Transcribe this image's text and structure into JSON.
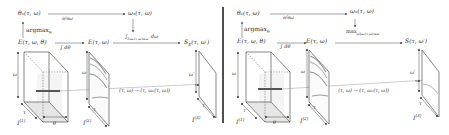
{
  "divider": {
    "x": 223,
    "y1": 7,
    "y2": 123,
    "color": "#222222"
  },
  "colors": {
    "line": "#555555",
    "light_line": "#888888",
    "face_fill": "#eeeeee",
    "bar": "#555555"
  },
  "panels": [
    {
      "id": "left",
      "theta_node": "θₑ(τ, ω)",
      "omega_node": "ωₑ(τ, ω)",
      "derivative_label": "∂/∂ω",
      "argmax_label": "argmax",
      "argmax_sub": "θ",
      "E_full_node": "E(τ, ω, θ)",
      "integral_theta_label": "∫",
      "integral_theta_limits": "π −π",
      "integral_theta_tail": "dθ",
      "E_node": "E(τ, ω)",
      "reduce_label": "∫",
      "reduce_sub": "δωₑ(τ,ω)=ω′",
      "reduce_tail": "dω",
      "output_node": "S",
      "output_sub": "E",
      "output_args": "(τ, ω′)",
      "mapping_label": "(τ, ω) → (τ, ωₑ(τ, ω))",
      "volume_labels": {
        "omega": "ω",
        "tau": "τ",
        "theta": "θ",
        "name": "I",
        "index": "(1)"
      },
      "slice2_labels": {
        "omega": "ω",
        "tau": "τ",
        "name": "I",
        "index": "(2)"
      },
      "slice3_labels": {
        "omega": "ω′",
        "tau": "τ",
        "name": "I",
        "index": "(3)"
      }
    },
    {
      "id": "right",
      "theta_node": "θₑ(τ, ω)",
      "omega_node": "ωₑ(τ, ω)",
      "derivative_label": "∂/∂ω",
      "argmax_label": "argmax",
      "argmax_sub": "θ",
      "E_full_node": "E(τ, ω, θ)",
      "integral_theta_label": "∫",
      "integral_theta_limits": "π −π",
      "integral_theta_tail": "dθ",
      "E_node": "E(τ, ω)",
      "reduce_label": "max",
      "reduce_sub": "ω|ωₑ(τ,ω)=ω′",
      "reduce_tail": "",
      "output_node": "S",
      "output_sub": "",
      "output_args": "(τ, ω′)",
      "mapping_label": "(τ, ω) → (τ, ωₑ(τ, ω))",
      "volume_labels": {
        "omega": "ω",
        "tau": "τ",
        "theta": "θ",
        "name": "I",
        "index": "(1)"
      },
      "slice2_labels": {
        "omega": "ω",
        "tau": "τ",
        "name": "I",
        "index": "(2)"
      },
      "slice3_labels": {
        "omega": "ω′",
        "tau": "τ",
        "name": "I",
        "index": "(3)"
      }
    }
  ]
}
